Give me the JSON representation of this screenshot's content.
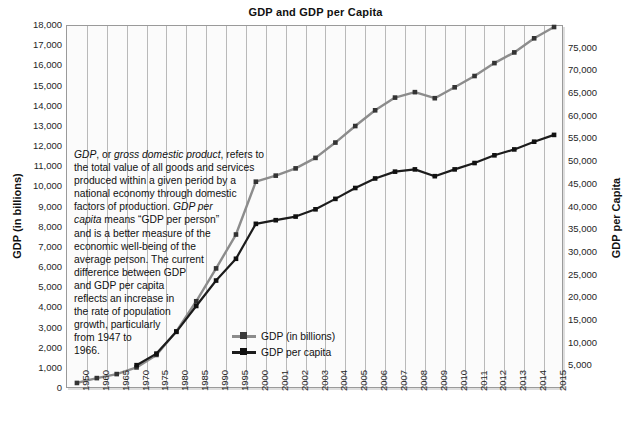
{
  "chart_data": {
    "type": "line",
    "title": "GDP and GDP per Capita",
    "xlabel": "",
    "ylabel": "GDP (in billions)",
    "y2label": "GDP per Capita",
    "grid": "vertical",
    "legend_position": "inside-bottom-center",
    "categories": [
      "1950",
      "1960",
      "1965",
      "1970",
      "1975",
      "1980",
      "1985",
      "1990",
      "1995",
      "2000",
      "2001",
      "2002",
      "2003",
      "2004",
      "2005",
      "2006",
      "2007",
      "2008",
      "2009",
      "2010",
      "2011",
      "2012",
      "2013",
      "2014",
      "2015"
    ],
    "ylim": [
      0,
      18000
    ],
    "yticks": [
      "0",
      "1,000",
      "2,000",
      "3,000",
      "4,000",
      "5,000",
      "6,000",
      "7,000",
      "8,000",
      "9,000",
      "10,000",
      "11,000",
      "12,000",
      "13,000",
      "14,000",
      "15,000",
      "16,000",
      "17,000",
      "18,000"
    ],
    "y2lim": [
      0,
      80000
    ],
    "y2ticks": [
      "5,000",
      "10,000",
      "15,000",
      "20,000",
      "25,000",
      "30,000",
      "35,000",
      "40,000",
      "45,000",
      "50,000",
      "55,000",
      "60,000",
      "65,000",
      "70,000",
      "75,000"
    ],
    "series": [
      {
        "name": "GDP (in billions)",
        "axis": "left",
        "color": "#8c8c8c",
        "marker": "square",
        "x": [
          "1950",
          "1960",
          "1965",
          "1970",
          "1975",
          "1980",
          "1985",
          "1990",
          "1995",
          "2000",
          "2001",
          "2002",
          "2003",
          "2004",
          "2005",
          "2006",
          "2007",
          "2008",
          "2009",
          "2010",
          "2011",
          "2012",
          "2013",
          "2014",
          "2015"
        ],
        "values": [
          300,
          540,
          740,
          1070,
          1690,
          2860,
          4350,
          5980,
          7660,
          10280,
          10580,
          10940,
          11460,
          12220,
          13040,
          13820,
          14450,
          14720,
          14420,
          14960,
          15520,
          16160,
          16690,
          17390,
          17950
        ]
      },
      {
        "name": "GDP per capita",
        "axis": "right",
        "color": "#1c1c1c",
        "marker": "square",
        "x": [
          "1970",
          "1975",
          "1980",
          "1985",
          "1990",
          "1995",
          "2000",
          "2001",
          "2002",
          "2003",
          "2004",
          "2005",
          "2006",
          "2007",
          "2008",
          "2009",
          "2010",
          "2011",
          "2012",
          "2013",
          "2014",
          "2015"
        ],
        "values": [
          5250,
          7800,
          12600,
          18300,
          23900,
          28700,
          36400,
          37200,
          38000,
          39600,
          41900,
          44300,
          46400,
          47900,
          48400,
          46900,
          48400,
          49800,
          51500,
          52800,
          54500,
          56000
        ]
      }
    ],
    "annotation": {
      "lines": [
        "GDP, or gross domestic product, refers to",
        "the total value of all goods and services",
        "produced within a given period by a",
        "national economy through domestic",
        "factors of production. GDP per",
        "capita means “GDP per person”",
        "and is a better measure of the",
        "economic well-being of the",
        "average person. The current",
        "difference between GDP",
        "and GDP per capita",
        "reflects an increase in",
        "the rate of population",
        "growth, particularly",
        "from 1947 to",
        "1966."
      ]
    },
    "colors": {
      "gdp_line": "#8c8c8c",
      "gdp_per_capita_line": "#1c1c1c",
      "gridline": "#b9b9b9",
      "plot_border": "#9a9a9a",
      "plot_background": "#fbfbfb"
    }
  }
}
